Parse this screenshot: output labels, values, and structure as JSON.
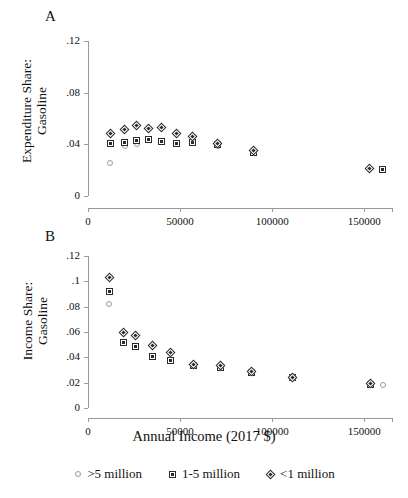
{
  "figure": {
    "xlabel": "Annual Income (2017 $)",
    "panelA_letter": "A",
    "panelB_letter": "B"
  },
  "legend": {
    "position": "bottom-center",
    "entries": [
      {
        "label": ">5 million",
        "marker": "circle-icon"
      },
      {
        "label": "1-5 million",
        "marker": "square-icon"
      },
      {
        "label": "<1 million",
        "marker": "diamond-icon"
      }
    ]
  },
  "chart_data": [
    {
      "type": "scatter",
      "panel": "A",
      "title": "",
      "ylabel_line1": "Expenditure Share:",
      "ylabel_line2": "Gasoline",
      "xlabel": "Annual Income (2017 $)",
      "xlim": [
        0,
        165000
      ],
      "ylim": [
        0,
        0.12
      ],
      "xticks": [
        0,
        50000,
        100000,
        150000
      ],
      "xticklabels": [
        "0",
        "50000",
        "100000",
        "150000"
      ],
      "yticks": [
        0,
        0.04,
        0.08,
        0.12
      ],
      "yticklabels": [
        "0",
        ".04",
        ".08",
        ".12"
      ],
      "grid": false,
      "series": [
        {
          "name": ">5 million",
          "marker": "circle",
          "points": [
            {
              "x": 12000,
              "y": 0.0255
            },
            {
              "x": 20000,
              "y": 0.039
            },
            {
              "x": 26500,
              "y": 0.0405
            },
            {
              "x": 33000,
              "y": 0.0432
            },
            {
              "x": 40000,
              "y": 0.042
            },
            {
              "x": 48000,
              "y": 0.0405
            },
            {
              "x": 56500,
              "y": 0.0408
            },
            {
              "x": 70500,
              "y": 0.0385
            },
            {
              "x": 90000,
              "y": 0.033
            },
            {
              "x": 160000,
              "y": 0.0205
            }
          ]
        },
        {
          "name": "1-5 million",
          "marker": "square",
          "points": [
            {
              "x": 12000,
              "y": 0.0408
            },
            {
              "x": 20000,
              "y": 0.0412
            },
            {
              "x": 26500,
              "y": 0.0428
            },
            {
              "x": 33000,
              "y": 0.044
            },
            {
              "x": 40000,
              "y": 0.0425
            },
            {
              "x": 48000,
              "y": 0.0408
            },
            {
              "x": 56500,
              "y": 0.0415
            },
            {
              "x": 70500,
              "y": 0.0398
            },
            {
              "x": 90000,
              "y": 0.034
            },
            {
              "x": 160000,
              "y": 0.0208
            }
          ]
        },
        {
          "name": "<1 million",
          "marker": "diamond",
          "points": [
            {
              "x": 12000,
              "y": 0.0485
            },
            {
              "x": 20000,
              "y": 0.0512
            },
            {
              "x": 26500,
              "y": 0.0548
            },
            {
              "x": 33000,
              "y": 0.052
            },
            {
              "x": 40000,
              "y": 0.0528
            },
            {
              "x": 48000,
              "y": 0.0485
            },
            {
              "x": 56500,
              "y": 0.0462
            },
            {
              "x": 70500,
              "y": 0.0408
            },
            {
              "x": 90000,
              "y": 0.0355
            },
            {
              "x": 153000,
              "y": 0.0212
            }
          ]
        }
      ]
    },
    {
      "type": "scatter",
      "panel": "B",
      "title": "",
      "ylabel_line1": "Income Share:",
      "ylabel_line2": "Gasoline",
      "xlabel": "Annual Income (2017 $)",
      "xlim": [
        0,
        165000
      ],
      "ylim": [
        0,
        0.12
      ],
      "xticks": [
        0,
        50000,
        100000,
        150000
      ],
      "xticklabels": [
        "0",
        "50000",
        "100000",
        "150000"
      ],
      "yticks": [
        0,
        0.02,
        0.04,
        0.06,
        0.08,
        0.1,
        0.12
      ],
      "yticklabels": [
        "0",
        ".02",
        ".04",
        ".06",
        ".08",
        ".1",
        ".12"
      ],
      "grid": false,
      "series": [
        {
          "name": ">5 million",
          "marker": "circle",
          "points": [
            {
              "x": 11500,
              "y": 0.082
            },
            {
              "x": 19000,
              "y": 0.052
            },
            {
              "x": 26000,
              "y": 0.057
            },
            {
              "x": 35000,
              "y": 0.0405
            },
            {
              "x": 45000,
              "y": 0.037
            },
            {
              "x": 57500,
              "y": 0.0335
            },
            {
              "x": 72000,
              "y": 0.0325
            },
            {
              "x": 88500,
              "y": 0.0278
            },
            {
              "x": 111000,
              "y": 0.0238
            },
            {
              "x": 160000,
              "y": 0.0185
            }
          ]
        },
        {
          "name": "1-5 million",
          "marker": "square",
          "points": [
            {
              "x": 11500,
              "y": 0.0918
            },
            {
              "x": 19000,
              "y": 0.0518
            },
            {
              "x": 26000,
              "y": 0.0488
            },
            {
              "x": 35000,
              "y": 0.0408
            },
            {
              "x": 45000,
              "y": 0.0372
            },
            {
              "x": 57500,
              "y": 0.0338
            },
            {
              "x": 72000,
              "y": 0.032
            },
            {
              "x": 88500,
              "y": 0.0282
            },
            {
              "x": 111000,
              "y": 0.0238
            },
            {
              "x": 153500,
              "y": 0.0182
            }
          ]
        },
        {
          "name": "<1 million",
          "marker": "diamond",
          "points": [
            {
              "x": 11500,
              "y": 0.1032
            },
            {
              "x": 19000,
              "y": 0.0598
            },
            {
              "x": 26000,
              "y": 0.0575
            },
            {
              "x": 35000,
              "y": 0.049
            },
            {
              "x": 45000,
              "y": 0.0435
            },
            {
              "x": 57500,
              "y": 0.034
            },
            {
              "x": 72000,
              "y": 0.0338
            },
            {
              "x": 88500,
              "y": 0.0288
            },
            {
              "x": 111000,
              "y": 0.024
            },
            {
              "x": 153500,
              "y": 0.019
            }
          ]
        }
      ]
    }
  ]
}
